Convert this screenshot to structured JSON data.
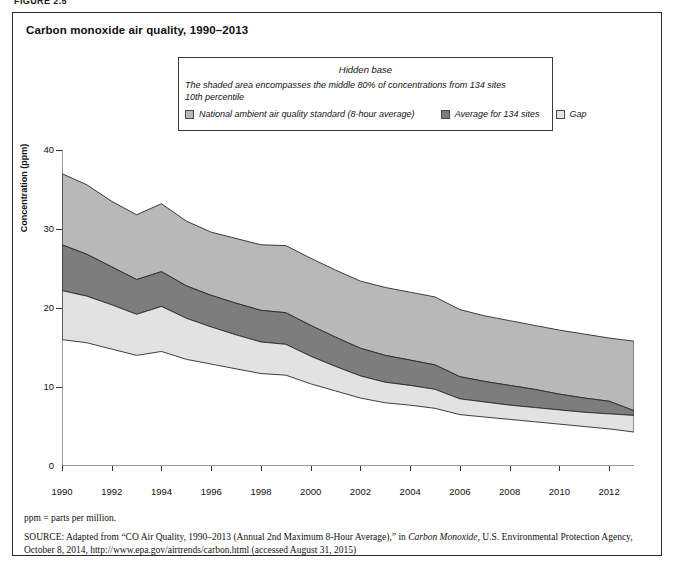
{
  "figure_label": "FIGURE 2.5",
  "title": "Carbon monoxide air quality, 1990–2013",
  "legend": {
    "hidden_base": "Hidden base",
    "description_line1": "The shaded area encompasses the middle 80% of concentrations from 134 sites",
    "description_line2": "10th percentile",
    "items": [
      {
        "label": "National ambient air quality standard (8-hour average)",
        "color": "#b8b8b8"
      },
      {
        "label": "Average for 134 sites",
        "color": "#7d7d7d"
      },
      {
        "label": "Gap",
        "color": "#e2e2e2"
      }
    ]
  },
  "footnote": "ppm = parts per million.",
  "source": {
    "prefix": "SOURCE:",
    "text_before_italic": " Adapted from “CO Air Quality, 1990–2013 (Annual 2nd Maximum 8-Hour Average),” in ",
    "italic_title": "Carbon Monoxide",
    "text_after_italic": ", U.S. Environmental Protection Agency, October 8, 2014, http://www.epa.gov/airtrends/carbon.html (accessed August 31, 2015)"
  },
  "chart_data": {
    "type": "area",
    "title": "Carbon monoxide air quality, 1990–2013",
    "xlabel": "",
    "ylabel": "Concentration (ppm)",
    "xlim": [
      1990,
      2013
    ],
    "ylim": [
      0,
      40
    ],
    "yticks": [
      0,
      10,
      20,
      30,
      40
    ],
    "xticks": [
      1990,
      1992,
      1994,
      1996,
      1998,
      2000,
      2002,
      2004,
      2006,
      2008,
      2010,
      2012
    ],
    "grid": false,
    "legend_position": "top",
    "x": [
      1990,
      1991,
      1992,
      1993,
      1994,
      1995,
      1996,
      1997,
      1998,
      1999,
      2000,
      2001,
      2002,
      2003,
      2004,
      2005,
      2006,
      2007,
      2008,
      2009,
      2010,
      2011,
      2012,
      2013
    ],
    "series": [
      {
        "name": "90th percentile (upper bound)",
        "values": [
          37.0,
          35.6,
          33.5,
          31.8,
          33.2,
          31.0,
          29.6,
          28.8,
          28.0,
          27.9,
          26.3,
          24.8,
          23.4,
          22.6,
          22.0,
          21.4,
          19.8,
          19.0,
          18.4,
          17.8,
          17.2,
          16.7,
          16.2,
          15.8
        ]
      },
      {
        "name": "Average for 134 sites (upper edge)",
        "values": [
          28.0,
          26.8,
          25.2,
          23.6,
          24.6,
          22.8,
          21.6,
          20.6,
          19.7,
          19.4,
          17.8,
          16.3,
          14.9,
          14.0,
          13.4,
          12.8,
          11.3,
          10.7,
          10.2,
          9.7,
          9.1,
          8.6,
          8.2,
          7.0
        ]
      },
      {
        "name": "Average for 134 sites (lower edge)",
        "values": [
          22.2,
          21.5,
          20.4,
          19.2,
          20.2,
          18.7,
          17.6,
          16.6,
          15.7,
          15.4,
          13.9,
          12.6,
          11.4,
          10.6,
          10.2,
          9.7,
          8.5,
          8.1,
          7.7,
          7.4,
          7.1,
          6.8,
          6.6,
          6.4
        ]
      },
      {
        "name": "10th percentile (lower bound)",
        "values": [
          16.0,
          15.6,
          14.8,
          14.0,
          14.5,
          13.5,
          12.9,
          12.3,
          11.7,
          11.5,
          10.4,
          9.5,
          8.6,
          8.0,
          7.7,
          7.3,
          6.5,
          6.2,
          5.9,
          5.6,
          5.3,
          5.0,
          4.7,
          4.3
        ]
      }
    ]
  }
}
